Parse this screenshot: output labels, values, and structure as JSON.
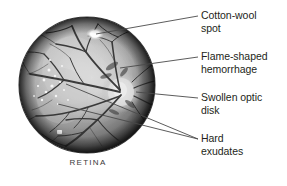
{
  "figure": {
    "caption": "RETINA",
    "background_color": "#ffffff",
    "text_color": "#231f20",
    "leader_line_color": "#4a4a4a"
  },
  "labels": [
    {
      "id": "cotton-wool-spot",
      "text": "Cotton-wool\nspot",
      "line1": "Cotton-wool",
      "line2": "spot"
    },
    {
      "id": "flame-shaped-hemorrhage",
      "text": "Flame-shaped\nhemorrhage",
      "line1": "Flame-shaped",
      "line2": "hemorrhage"
    },
    {
      "id": "swollen-optic-disk",
      "text": "Swollen optic\ndisk",
      "line1": "Swollen optic",
      "line2": "disk"
    },
    {
      "id": "hard-exudates",
      "text": "Hard\nexudates",
      "line1": "Hard",
      "line2": "exudates"
    }
  ],
  "anatomy": {
    "sphere": {
      "center_x": 87,
      "center_y": 85,
      "radius": 68,
      "highlight_color": "#d9d9d9",
      "midtone_color": "#8e8e8e",
      "shadow_color": "#2a2a2a"
    },
    "features": [
      {
        "name": "cotton-wool-spot",
        "x": 95,
        "y": 34
      },
      {
        "name": "optic-disk",
        "x": 120,
        "y": 92
      },
      {
        "name": "hard-exudates-cluster",
        "x": 52,
        "y": 86
      },
      {
        "name": "flame-shaped-hemorrhage",
        "x": 118,
        "y": 62
      }
    ]
  }
}
